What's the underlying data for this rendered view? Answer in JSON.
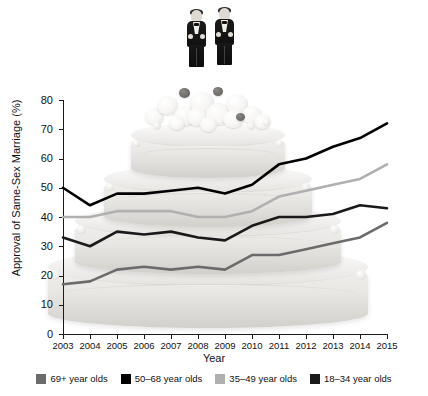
{
  "chart_data": {
    "type": "line",
    "title": "",
    "xlabel": "Year",
    "ylabel": "Approval of Same-Sex Marriage (%)",
    "xlim": [
      2003,
      2015
    ],
    "ylim": [
      0,
      80
    ],
    "ytick_step": 10,
    "grid": false,
    "legend_position": "bottom",
    "x": [
      2003,
      2004,
      2005,
      2006,
      2007,
      2008,
      2009,
      2010,
      2011,
      2012,
      2013,
      2014,
      2015
    ],
    "categories": [
      "2003",
      "2004",
      "2005",
      "2006",
      "2007",
      "2008",
      "2009",
      "2010",
      "2011",
      "2012",
      "2013",
      "2014",
      "2015"
    ],
    "yticks": [
      "0",
      "10",
      "20",
      "30",
      "40",
      "50",
      "60",
      "70",
      "80"
    ],
    "series": [
      {
        "name": "69+ year olds",
        "color": "#6b6b6b",
        "values": [
          17,
          18,
          22,
          23,
          22,
          23,
          22,
          27,
          27,
          29,
          31,
          33,
          38
        ]
      },
      {
        "name": "50–68 year olds",
        "color": "#000000",
        "values": [
          50,
          44,
          48,
          48,
          49,
          50,
          48,
          51,
          58,
          60,
          64,
          67,
          72
        ]
      },
      {
        "name": "35–49 year olds",
        "color": "#b0b0b0",
        "values": [
          40,
          40,
          42,
          42,
          42,
          40,
          40,
          42,
          47,
          49,
          51,
          53,
          58
        ]
      },
      {
        "name": "18–34 year olds",
        "color": "#1a1a1a",
        "values": [
          33,
          30,
          35,
          34,
          35,
          33,
          32,
          37,
          40,
          40,
          41,
          44,
          43
        ]
      }
    ]
  },
  "legend": {
    "items": [
      {
        "label": "69+ year olds",
        "color": "#6b6b6b"
      },
      {
        "label": "50–68 year olds",
        "color": "#000000"
      },
      {
        "label": "35–49 year olds",
        "color": "#b0b0b0"
      },
      {
        "label": "18–34 year olds",
        "color": "#1a1a1a"
      }
    ]
  },
  "illustration": {
    "name": "wedding-cake-with-two-groom-figurines",
    "tiers": 4,
    "topper": "two-grooms-in-tuxedos"
  }
}
